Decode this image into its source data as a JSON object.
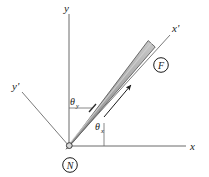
{
  "figure": {
    "background_color": "#ffffff",
    "line_color": "#4a4a4a",
    "ink_color": "#1a1a1a",
    "rod_fill_color": "#a9a9a9",
    "rod_edge_color": "#5a5a5a"
  },
  "axes": {
    "global": {
      "x_label": "x",
      "y_label": "y"
    },
    "body": {
      "x_label": "x'",
      "y_label": "y'"
    }
  },
  "angles": {
    "theta_y": {
      "symbol": "θ",
      "subscript": "y"
    },
    "theta_x": {
      "symbol": "θ",
      "subscript": "x"
    }
  },
  "nodes": {
    "origin": {
      "label": "N"
    },
    "tip": {
      "label": "F"
    }
  },
  "rod": {
    "direction_arrow": "axial-arrow"
  }
}
